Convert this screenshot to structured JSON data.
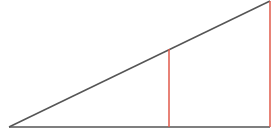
{
  "diagram": {
    "title": "",
    "colors": {
      "background": "#ffffff",
      "triangle_line": "#555555",
      "vertical_line": "#e0584a"
    },
    "vertex": {
      "x": 9,
      "y": 127
    },
    "base_end": {
      "x": 270,
      "y": 127
    },
    "hypotenuse_end": {
      "x": 270,
      "y": 1
    },
    "verticals": [
      {
        "x": 169,
        "top": 49,
        "bottom": 127
      },
      {
        "x": 270,
        "top": 1,
        "bottom": 127
      }
    ]
  }
}
